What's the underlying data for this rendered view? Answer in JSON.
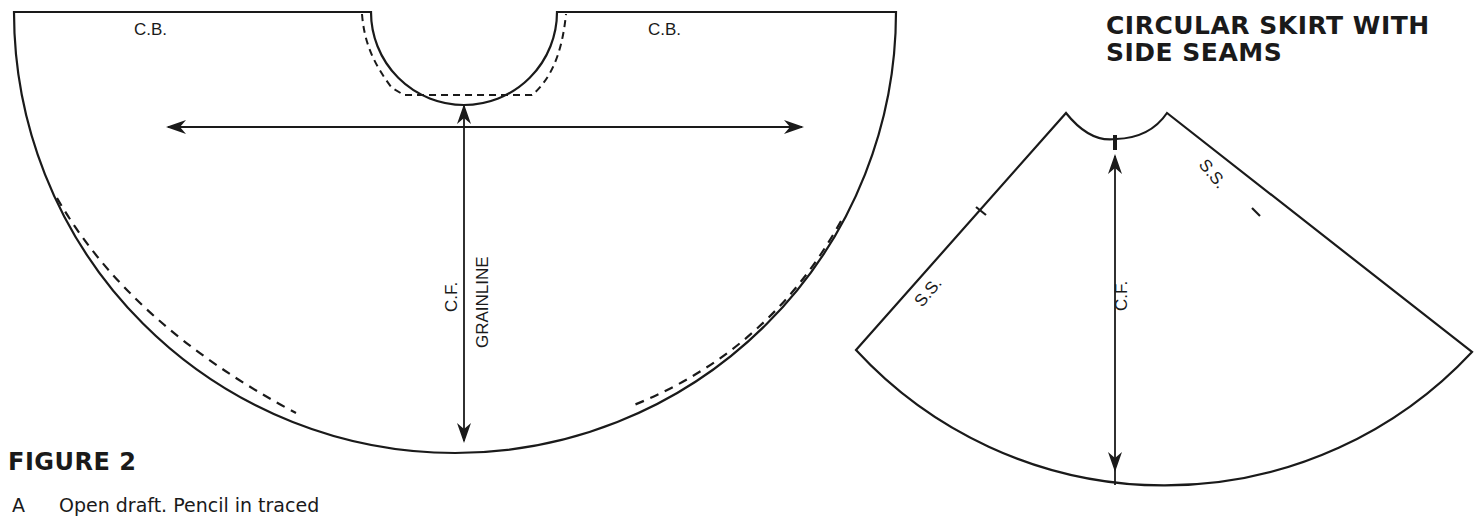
{
  "figure": {
    "title": "FIGURE 2",
    "caption_marker": "A",
    "caption_text": "Open draft. Pencil in traced"
  },
  "left_pattern": {
    "labels": {
      "cb_left": "C.B.",
      "cb_right": "C.B.",
      "cf": "C.F.",
      "grainline": "GRAINLINE"
    }
  },
  "right_pattern": {
    "title_line1": "CIRCULAR SKIRT WITH",
    "title_line2": "SIDE SEAMS",
    "labels": {
      "ss_left": "S.S.",
      "ss_right": "S.S.",
      "cf": "C.F."
    }
  },
  "colors": {
    "ink": "#1a1a1a",
    "paper": "#ffffff"
  }
}
